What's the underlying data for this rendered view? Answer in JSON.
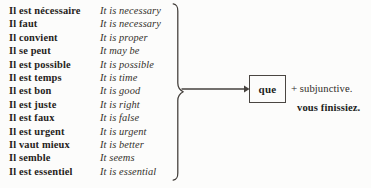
{
  "document": {
    "type": "grammar-reference-diagram",
    "ink_color": "#2a2724",
    "paper_color": "#fcfcfb"
  },
  "expressions": {
    "columns": [
      "French impersonal expression",
      "English translation"
    ],
    "rows": [
      {
        "french": "Il est nécessaire",
        "english": "It is necessary"
      },
      {
        "french": "Il faut",
        "english": "It is necessary"
      },
      {
        "french": "Il convient",
        "english": "It is proper"
      },
      {
        "french": "Il se peut",
        "english": "It may be"
      },
      {
        "french": "Il est possible",
        "english": "It is possible"
      },
      {
        "french": "Il est temps",
        "english": "It is time"
      },
      {
        "french": "Il est bon",
        "english": "It is good"
      },
      {
        "french": "Il est juste",
        "english": "It is right"
      },
      {
        "french": "Il est faux",
        "english": "It is false"
      },
      {
        "french": "Il est urgent",
        "english": "It is urgent"
      },
      {
        "french": "Il vaut mieux",
        "english": "It is better"
      },
      {
        "french": "Il semble",
        "english": "It seems"
      },
      {
        "french": "Il est essentiel",
        "english": "It is essential"
      }
    ]
  },
  "connector": {
    "brace_icon": "right-curly-brace-icon",
    "arrow_icon": "right-arrow-icon"
  },
  "conjunction_box": {
    "label": "que"
  },
  "notes": {
    "plus_sign": "+",
    "rule": "subjunctive.",
    "example": "vous finissiez."
  }
}
